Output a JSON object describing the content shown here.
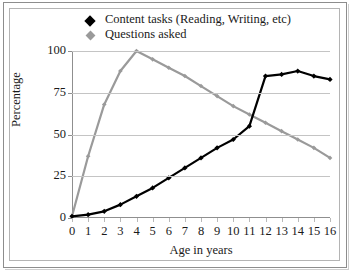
{
  "chart_data": {
    "type": "line",
    "title": "",
    "xlabel": "Age in years",
    "ylabel": "Percentage",
    "grid": true,
    "legend_position": "top",
    "x": [
      0,
      1,
      2,
      3,
      4,
      5,
      6,
      7,
      8,
      9,
      10,
      11,
      12,
      13,
      14,
      15,
      16
    ],
    "xlim": [
      0,
      16
    ],
    "ylim": [
      0,
      100
    ],
    "yticks": [
      0,
      25,
      50,
      75,
      100
    ],
    "xticks": [
      "0",
      "1",
      "2",
      "3",
      "4",
      "5",
      "6",
      "7",
      "8",
      "9",
      "10",
      "11",
      "12",
      "13",
      "14",
      "15",
      "16"
    ],
    "series": [
      {
        "name": "Content tasks (Reading, Writing, etc)",
        "color": "#000000",
        "marker": "diamond",
        "values": [
          1,
          2,
          4,
          8,
          13,
          18,
          24,
          30,
          36,
          42,
          47,
          55,
          85,
          86,
          88,
          85,
          83
        ]
      },
      {
        "name": "Questions asked",
        "color": "#9a9a9a",
        "marker": "diamond",
        "values": [
          1,
          37,
          68,
          88,
          100,
          95,
          90,
          85,
          79,
          73,
          67,
          62,
          57,
          52,
          47,
          42,
          36
        ]
      }
    ]
  },
  "legend": {
    "items": [
      {
        "label": "Content tasks (Reading, Writing, etc)"
      },
      {
        "label": "Questions asked"
      }
    ]
  },
  "axes": {
    "y_title": "Percentage",
    "x_title": "Age in years",
    "y_labels": [
      "100",
      "75",
      "50",
      "25",
      "0"
    ],
    "x_labels": [
      "0",
      "1",
      "2",
      "3",
      "4",
      "5",
      "6",
      "7",
      "8",
      "9",
      "10",
      "11",
      "12",
      "13",
      "14",
      "15",
      "16"
    ]
  },
  "colors": {
    "series_one": "#000000",
    "series_two": "#9a9a9a",
    "grid": "#c4c4c4",
    "axis": "#8f8f8f",
    "frame": "#b4b4b4",
    "text": "#1a1a1a"
  }
}
